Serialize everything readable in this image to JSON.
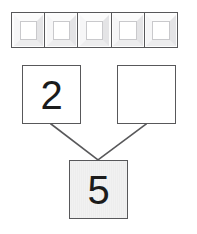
{
  "worksheet": {
    "kind": "number-bond",
    "background_color": "#ffffff",
    "line_color": "#58585a",
    "digit_color": "#1b1b1b"
  },
  "manipulatives": {
    "label": "unit cubes row",
    "count": 5,
    "items": [
      {
        "index": 1,
        "value": "",
        "icon": "cube-icon"
      },
      {
        "index": 2,
        "value": "",
        "icon": "cube-icon"
      },
      {
        "index": 3,
        "value": "",
        "icon": "cube-icon"
      },
      {
        "index": 4,
        "value": "",
        "icon": "cube-icon"
      },
      {
        "index": 5,
        "value": "",
        "icon": "cube-icon"
      }
    ]
  },
  "bond": {
    "part_left": {
      "value": "2",
      "filled": true,
      "fill_color": "#ffffff"
    },
    "part_right": {
      "value": "",
      "placeholder": "",
      "filled": false,
      "fill_color": "#ffffff"
    },
    "whole": {
      "value": "5",
      "filled": true,
      "fill_color": "#f1f1f1"
    }
  },
  "connectors": [
    {
      "name": "left-branch",
      "x1": 51,
      "y1": 124,
      "x2": 98,
      "y2": 160
    },
    {
      "name": "right-branch",
      "x1": 146,
      "y1": 124,
      "x2": 98,
      "y2": 160
    }
  ]
}
